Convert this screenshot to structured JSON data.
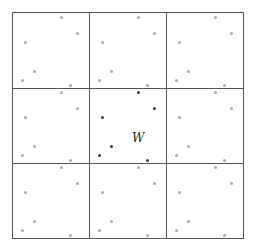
{
  "diagram": {
    "type": "periodic-tiling-3x3",
    "center_label": "W",
    "grid": {
      "x_lines": [
        12,
        89,
        166,
        243
      ],
      "y_lines": [
        12,
        88,
        163,
        238
      ],
      "line_color": "#555555"
    },
    "point_offsets": [
      [
        49,
        5
      ],
      [
        65,
        21
      ],
      [
        13,
        30
      ],
      [
        22,
        59
      ],
      [
        10,
        68
      ],
      [
        58,
        73
      ]
    ],
    "colors": {
      "replica_point": "#a8a8a8",
      "central_point": "#3a3a3a"
    },
    "center_cell": {
      "row": 1,
      "col": 1
    }
  }
}
